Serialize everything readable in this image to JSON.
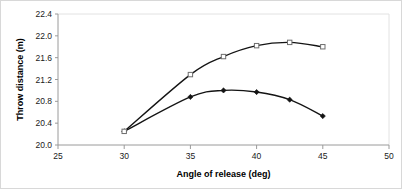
{
  "chart_data": {
    "type": "line",
    "title": "",
    "subtitle": "",
    "xlabel": "Angle of release (deg)",
    "ylabel": "Throw distance (m)",
    "xlim": [
      25,
      50
    ],
    "ylim": [
      20.0,
      22.4
    ],
    "xticks": [
      25,
      30,
      35,
      40,
      45,
      50
    ],
    "yticks": [
      20.0,
      20.4,
      20.8,
      21.2,
      21.6,
      22.0,
      22.4
    ],
    "xtick_labels": [
      "25",
      "30",
      "35",
      "40",
      "45",
      "50"
    ],
    "ytick_labels": [
      "20.0",
      "20.4",
      "20.8",
      "21.2",
      "21.6",
      "22.0",
      "22.4"
    ],
    "grid": false,
    "legend": "none",
    "annotations": [],
    "series": [
      {
        "name": "lower-series",
        "marker": "diamond",
        "marker_color": "#141414",
        "line_color": "#141414",
        "x": [
          30,
          35,
          37.5,
          40,
          42.5,
          45
        ],
        "values": [
          20.25,
          20.88,
          21.0,
          20.97,
          20.83,
          20.53
        ]
      },
      {
        "name": "upper-series",
        "marker": "square",
        "marker_color": "#ffffff",
        "line_color": "#141414",
        "x": [
          30,
          35,
          37.5,
          40,
          42.5,
          45
        ],
        "values": [
          20.25,
          21.29,
          21.62,
          21.82,
          21.88,
          21.8
        ]
      }
    ]
  },
  "colors": {
    "background": "#ffffff",
    "axis": "#9a9a9a",
    "text": "#1a1a1a",
    "series_line": "#141414",
    "frame": "#d8d8d8"
  }
}
